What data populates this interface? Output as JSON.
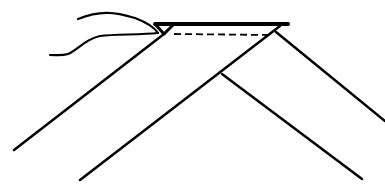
{
  "diagram": {
    "title": "",
    "colors": {
      "stroke": "#000000",
      "background": "#ffffff"
    },
    "elements": [
      {
        "id": "thread",
        "type": "curve",
        "label": ""
      },
      {
        "id": "top-band",
        "type": "trapezoid",
        "label": ""
      },
      {
        "id": "fold-line",
        "type": "dashed-line",
        "label": ""
      },
      {
        "id": "outer-left-edge",
        "type": "line",
        "label": ""
      },
      {
        "id": "inner-left-edge",
        "type": "line",
        "label": ""
      },
      {
        "id": "outer-right-edge",
        "type": "line",
        "label": ""
      },
      {
        "id": "inner-right-edge",
        "type": "line",
        "label": ""
      }
    ]
  }
}
